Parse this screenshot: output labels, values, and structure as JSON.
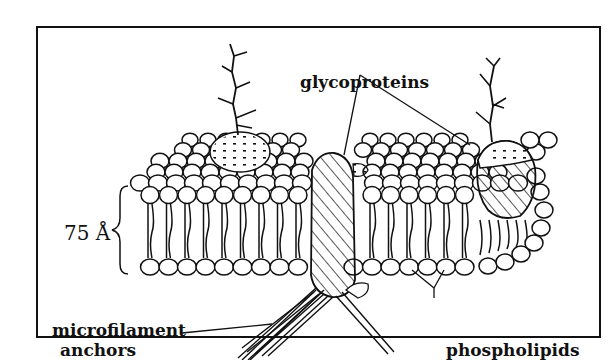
{
  "diagram": {
    "labels": {
      "thickness": "75 Å",
      "glycoproteins": "glycoproteins",
      "microfilament_line1": "microfilament",
      "microfilament_line2": "anchors",
      "phospholipids": "phospholipids"
    },
    "colors": {
      "ink": "#111111",
      "background": "#ffffff"
    }
  }
}
